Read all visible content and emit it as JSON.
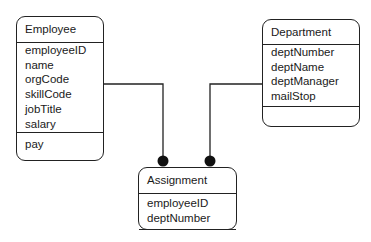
{
  "diagram": {
    "type": "UML class diagram",
    "classes": [
      {
        "name": "Employee",
        "attributes": [
          "employeeID",
          "name",
          "orgCode",
          "skillCode",
          "jobTitle",
          "salary"
        ],
        "operations": [
          "pay"
        ]
      },
      {
        "name": "Department",
        "attributes": [
          "deptNumber",
          "deptName",
          "deptManager",
          "mailStop"
        ],
        "operations": []
      },
      {
        "name": "Assignment",
        "attributes": [
          "employeeID",
          "deptNumber"
        ],
        "operations": []
      }
    ],
    "associations": [
      {
        "from": "Employee",
        "to": "Assignment",
        "end_marker": "filled-circle"
      },
      {
        "from": "Department",
        "to": "Assignment",
        "end_marker": "filled-circle"
      }
    ]
  }
}
